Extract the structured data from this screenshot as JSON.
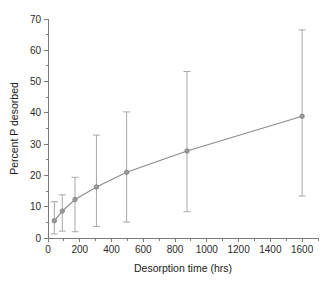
{
  "chart_data": {
    "type": "line",
    "title": "",
    "xlabel": "Desorption time (hrs)",
    "ylabel": "Percent P desorbed",
    "xlim": [
      0,
      1700
    ],
    "ylim": [
      0,
      70
    ],
    "grid": false,
    "legend": null,
    "xticks": [
      0,
      200,
      400,
      600,
      800,
      1000,
      1200,
      1400,
      1600
    ],
    "xtick_labels": [
      "0",
      "200",
      "400",
      "600",
      "800",
      "1000",
      "1200",
      "1400",
      "1600"
    ],
    "xminor_step": 100,
    "yticks": [
      0,
      10,
      20,
      30,
      40,
      50,
      60,
      70
    ],
    "ytick_labels": [
      "0",
      "10",
      "20",
      "30",
      "40",
      "50",
      "60",
      "70"
    ],
    "yminor_step": 5,
    "x": [
      40,
      90,
      170,
      305,
      495,
      875,
      1600
    ],
    "values": [
      5.5,
      8.6,
      12.3,
      16.3,
      21.0,
      27.8,
      38.9
    ],
    "error_upper": [
      11.6,
      13.8,
      19.4,
      32.9,
      40.3,
      53.2,
      66.5
    ],
    "error_lower": [
      1.3,
      2.2,
      2.0,
      3.7,
      5.1,
      8.4,
      13.4
    ],
    "line_color": "#8c8c8c",
    "marker_color": "#9a9a9a",
    "error_color": "#a8a8a8",
    "axis_color": "#7a7a7a",
    "text_color": "#1a1a1a"
  },
  "axis": {
    "x_title": "Desorption time (hrs)",
    "y_title": "Percent P desorbed"
  }
}
